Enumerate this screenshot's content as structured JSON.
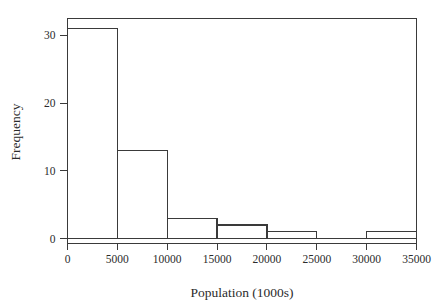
{
  "chart_data": {
    "type": "bar",
    "title": "",
    "subtitle": "",
    "xlabel": "Population (1000s)",
    "ylabel": "Frequency",
    "bin_edges": [
      0,
      5000,
      10000,
      15000,
      20000,
      25000,
      30000,
      35000
    ],
    "categories": [
      "0-5000",
      "5000-10000",
      "10000-15000",
      "15000-20000",
      "20000-25000",
      "25000-30000",
      "30000-35000"
    ],
    "values": [
      31,
      13,
      3,
      2,
      1,
      0,
      1
    ],
    "xlim": [
      0,
      35000
    ],
    "ylim": [
      0,
      32.5
    ],
    "xticks": [
      0,
      5000,
      10000,
      15000,
      20000,
      25000,
      30000,
      35000
    ],
    "xtick_labels": [
      "0",
      "5000",
      "10000",
      "15000",
      "20000",
      "25000",
      "30000",
      "35000"
    ],
    "yticks": [
      0,
      10,
      20,
      30
    ],
    "ytick_labels": [
      "0",
      "10",
      "20",
      "30"
    ],
    "grid": false,
    "legend": false,
    "legend_position": "none",
    "bar_fill": "#ffffff",
    "bar_edge": "#3a3a3a",
    "axis_color": "#3a3a3a",
    "background": "#ffffff"
  }
}
